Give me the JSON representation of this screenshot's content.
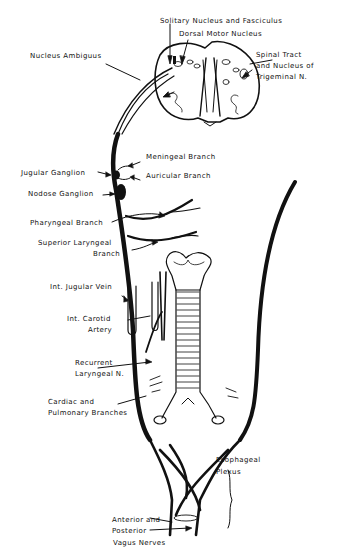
{
  "diagram": {
    "colors": {
      "ink": "#111111",
      "paper": "#ffffff"
    },
    "labels": {
      "solitary": "Solitary Nucleus and Fasciculus",
      "dorsal_motor": "Dorsal Motor Nucleus",
      "spinal_tract_1": "Spinal Tract",
      "spinal_tract_2": "and Nucleus of",
      "spinal_tract_3": "Trigeminal N.",
      "ambiguus": "Nucleus Ambiguus",
      "meningeal": "Meningeal Branch",
      "jugular_ganglion": "Jugular Ganglion",
      "auricular": "Auricular Branch",
      "nodose": "Nodose Ganglion",
      "pharyngeal": "Pharyngeal Branch",
      "sup_laryngeal_1": "Superior Laryngeal",
      "sup_laryngeal_2": "Branch",
      "ij_vein": "Int. Jugular Vein",
      "int_carotid_1": "Int. Carotid",
      "int_carotid_2": "Artery",
      "recurrent_1": "Recurrent",
      "recurrent_2": "Laryngeal N.",
      "cardiac_1": "Cardiac and",
      "cardiac_2": "Pulmonary Branches",
      "esoph_1": "Esophageal",
      "esoph_2": "Plexus",
      "vagus_1": "Anterior and",
      "vagus_2": "Posterior",
      "vagus_3": "Vagus Nerves"
    }
  }
}
